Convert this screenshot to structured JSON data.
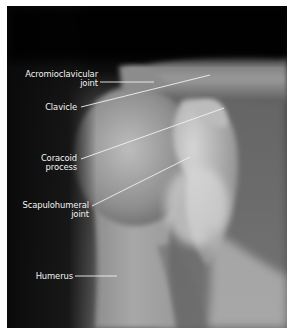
{
  "figure": {
    "background": "#060606",
    "border_color": "#ffffff"
  },
  "labels": [
    {
      "id": "acromioclavicular",
      "line1": "Acromioclavicular",
      "line2": "joint"
    },
    {
      "id": "clavicle",
      "line1": "Clavicle"
    },
    {
      "id": "coracoid",
      "line1": "Coracoid",
      "line2": "process"
    },
    {
      "id": "scapulohumeral",
      "line1": "Scapulohumeral",
      "line2": "joint"
    },
    {
      "id": "humerus",
      "line1": "Humerus"
    }
  ]
}
